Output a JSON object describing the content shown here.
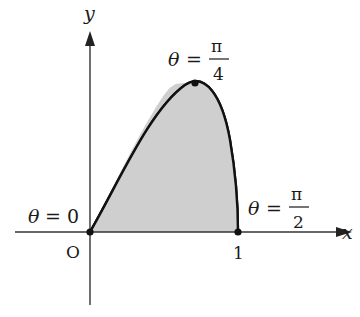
{
  "diagram": {
    "colors": {
      "axis": "#333333",
      "curve": "#111111",
      "fill": "#cfcfcf",
      "text": "#1a1a1a"
    },
    "axes": {
      "x_label": "x",
      "y_label": "y",
      "origin_label": "O",
      "x_tick_label": "1"
    },
    "points": [
      {
        "name": "start",
        "label_lhs": "θ",
        "label_eq": "=",
        "label_value": "0",
        "x": 0,
        "y": 0
      },
      {
        "name": "peak",
        "label_lhs": "θ",
        "label_eq": "=",
        "label_num": "π",
        "label_den": "4",
        "x": 0.7071,
        "y": 1
      },
      {
        "name": "end",
        "label_lhs": "θ",
        "label_eq": "=",
        "label_num": "π",
        "label_den": "2",
        "x": 1,
        "y": 0
      }
    ],
    "curve": {
      "param_x": "sin θ",
      "param_y": "sin 2θ",
      "theta_range": [
        "0",
        "π/2"
      ]
    }
  }
}
